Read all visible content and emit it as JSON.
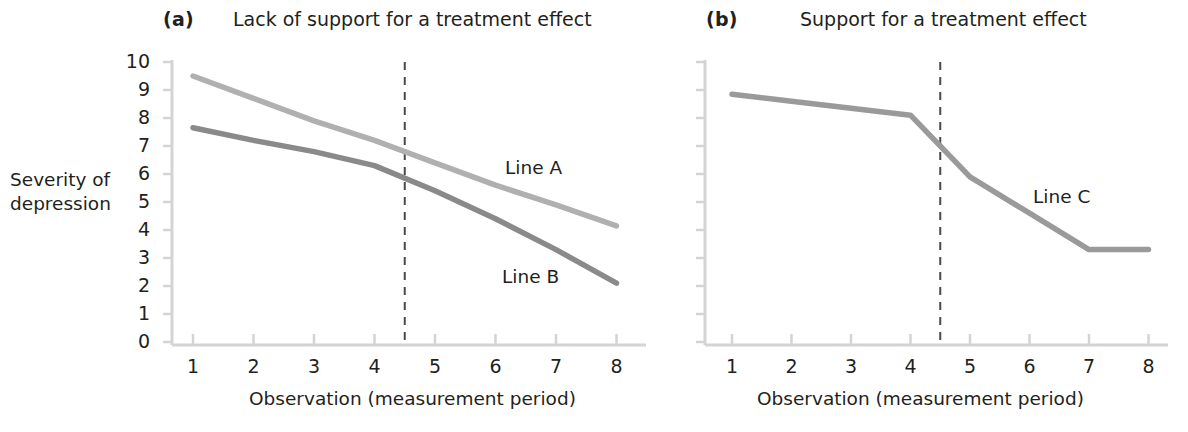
{
  "figure": {
    "y_axis_title_line1": "Severity of",
    "y_axis_title_line2": "depression",
    "x_axis_title": "Observation (measurement period)"
  },
  "panels": [
    {
      "tag": "(a)",
      "title": "Lack of support for a treatment effect",
      "x_axis_title": "Observation (measurement period)"
    },
    {
      "tag": "(b)",
      "title": "Support for a treatment effect",
      "x_axis_title": "Observation (measurement period)"
    }
  ],
  "y_ticks": [
    "10",
    "9",
    "8",
    "7",
    "6",
    "5",
    "4",
    "3",
    "2",
    "1",
    "0"
  ],
  "x_ticks": [
    "1",
    "2",
    "3",
    "4",
    "5",
    "6",
    "7",
    "8"
  ],
  "series_labels": {
    "line_a": "Line A",
    "line_b": "Line B",
    "line_c": "Line C"
  },
  "colors": {
    "line_a": "#b0b0b0",
    "line_b": "#8a8a8a",
    "line_c": "#9a9a9a",
    "axis": "#d4d4d4",
    "dashed_marker": "#4a4a4a",
    "text": "#231f20"
  },
  "chart_data": [
    {
      "type": "line",
      "title": "Lack of support for a treatment effect",
      "panel_tag": "(a)",
      "xlabel": "Observation (measurement period)",
      "ylabel": "Severity of depression",
      "xlim": [
        0.5,
        8.5
      ],
      "ylim": [
        0,
        10
      ],
      "grid": false,
      "legend": "inline-labels",
      "x": [
        1,
        2,
        3,
        4,
        5,
        6,
        7,
        8
      ],
      "series": [
        {
          "name": "Line A",
          "values": [
            9.5,
            8.7,
            7.9,
            7.2,
            6.4,
            5.6,
            4.9,
            4.15
          ],
          "color": "#b0b0b0"
        },
        {
          "name": "Line B",
          "values": [
            7.65,
            7.2,
            6.8,
            6.3,
            5.4,
            4.4,
            3.3,
            2.1
          ],
          "color": "#8a8a8a"
        }
      ],
      "annotations": [
        {
          "type": "vertical-dashed-line",
          "x": 4.5,
          "label": "treatment introduced"
        }
      ]
    },
    {
      "type": "line",
      "title": "Support for a treatment effect",
      "panel_tag": "(b)",
      "xlabel": "Observation (measurement period)",
      "ylabel": "Severity of depression",
      "xlim": [
        0.5,
        8.5
      ],
      "ylim": [
        0,
        10
      ],
      "grid": false,
      "legend": "inline-labels",
      "x": [
        1,
        2,
        3,
        4,
        5,
        6,
        7,
        8
      ],
      "series": [
        {
          "name": "Line C",
          "values": [
            8.85,
            8.6,
            8.35,
            8.1,
            5.9,
            4.6,
            3.3,
            3.3
          ],
          "color": "#9a9a9a"
        }
      ],
      "annotations": [
        {
          "type": "vertical-dashed-line",
          "x": 4.5,
          "label": "treatment introduced"
        }
      ]
    }
  ]
}
